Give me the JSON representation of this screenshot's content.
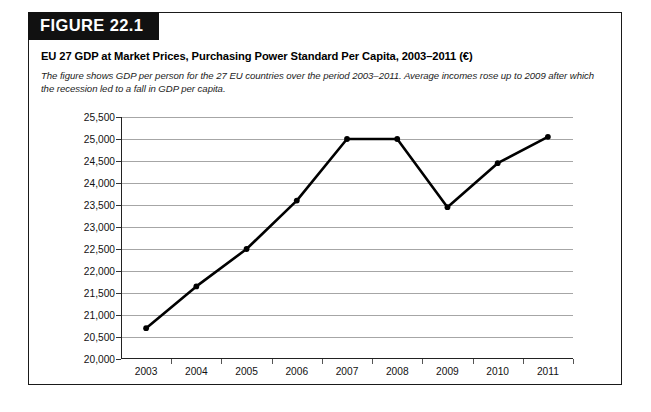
{
  "figure": {
    "badge": "FIGURE 22.1",
    "title": "EU 27 GDP at Market Prices, Purchasing Power Standard Per Capita, 2003–2011 (€)",
    "caption": "The figure shows GDP per person for the 27 EU countries over the period 2003–2011. Average incomes rose up to 2009 after which the recession led to a fall in GDP per capita."
  },
  "colors": {
    "banner_background": "#111111",
    "banner_text": "#ffffff",
    "border": "#1a1a1a",
    "gridline": "#a6a6a6",
    "axis": "#222222",
    "series_line": "#000000",
    "page_background": "#ffffff"
  },
  "chart_data": {
    "type": "line",
    "title": "EU 27 GDP at Market Prices, Purchasing Power Standard Per Capita, 2003–2011 (€)",
    "xlabel": "",
    "ylabel": "",
    "categories": [
      "2003",
      "2004",
      "2005",
      "2006",
      "2007",
      "2008",
      "2009",
      "2010",
      "2011"
    ],
    "values": [
      20700,
      21650,
      22500,
      23600,
      25000,
      25000,
      23450,
      24450,
      25050
    ],
    "series": [
      {
        "name": "EU 27 GDP per capita (PPS, €)",
        "values": [
          20700,
          21650,
          22500,
          23600,
          25000,
          25000,
          23450,
          24450,
          25050
        ]
      }
    ],
    "ylim": [
      20000,
      25500
    ],
    "ytick_values": [
      25500,
      25000,
      24500,
      24000,
      23500,
      23000,
      22500,
      22000,
      21500,
      21000,
      20500,
      20000
    ],
    "ytick_labels": [
      "25,500",
      "25,000",
      "24,500",
      "24,000",
      "23,500",
      "23,000",
      "22,500",
      "22,000",
      "21,500",
      "21,000",
      "20,500",
      "20,000"
    ],
    "grid": true,
    "grid_axis": "y",
    "legend": false,
    "markers": true
  }
}
